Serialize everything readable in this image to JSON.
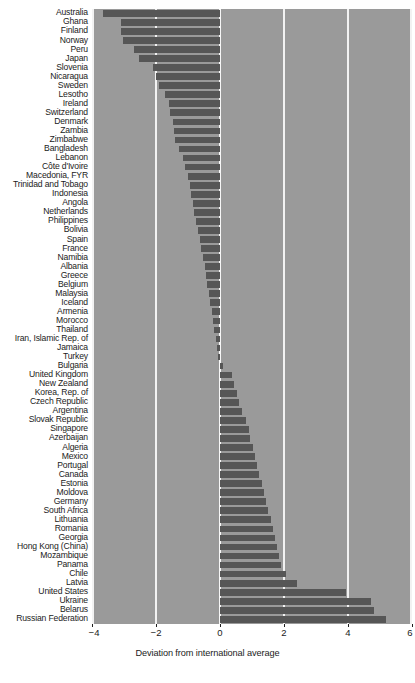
{
  "chart_data": {
    "type": "bar",
    "orientation": "horizontal",
    "title": "",
    "subtitle": "",
    "xlabel": "Deviation from international average",
    "ylabel": "",
    "xlim": [
      -4,
      6
    ],
    "ylim": null,
    "grid": true,
    "gridlines_x": [
      -4,
      -2,
      0,
      2,
      4,
      6
    ],
    "xticks": [
      -4,
      -2,
      0,
      2,
      4,
      6
    ],
    "xticklabels": [
      "−4",
      "−2",
      "0",
      "2",
      "4",
      "6"
    ],
    "legend": null,
    "legend_position": "none",
    "bar_color": "#565656",
    "plot_background_color": "#9a9a9a",
    "gridline_color": "#f2f2f2",
    "figure_background_color": "#ffffff",
    "categories": [
      "Australia",
      "Ghana",
      "Finland",
      "Norway",
      "Peru",
      "Japan",
      "Slovenia",
      "Nicaragua",
      "Sweden",
      "Lesotho",
      "Ireland",
      "Switzerland",
      "Denmark",
      "Zambia",
      "Zimbabwe",
      "Bangladesh",
      "Lebanon",
      "Côte d'Ivoire",
      "Macedonia, FYR",
      "Trinidad and Tobago",
      "Indonesia",
      "Angola",
      "Netherlands",
      "Philippines",
      "Bolivia",
      "Spain",
      "France",
      "Namibia",
      "Albania",
      "Greece",
      "Belgium",
      "Malaysia",
      "Iceland",
      "Armenia",
      "Morocco",
      "Thailand",
      "Iran, Islamic Rep. of",
      "Jamaica",
      "Turkey",
      "Bulgaria",
      "United Kingdom",
      "New Zealand",
      "Korea, Rep. of",
      "Czech Republic",
      "Argentina",
      "Slovak Republic",
      "Singapore",
      "Azerbaijan",
      "Algeria",
      "Mexico",
      "Portugal",
      "Canada",
      "Estonia",
      "Moldova",
      "Germany",
      "South Africa",
      "Lithuania",
      "Romania",
      "Georgia",
      "Hong Kong (China)",
      "Mozambique",
      "Panama",
      "Chile",
      "Latvia",
      "United States",
      "Ukraine",
      "Belarus",
      "Russian Federation"
    ],
    "values": [
      -3.65,
      -3.1,
      -3.08,
      -3.02,
      -2.7,
      -2.52,
      -2.08,
      -2.0,
      -1.9,
      -1.72,
      -1.58,
      -1.55,
      -1.48,
      -1.45,
      -1.4,
      -1.28,
      -1.15,
      -1.1,
      -1.0,
      -0.95,
      -0.9,
      -0.85,
      -0.8,
      -0.75,
      -0.7,
      -0.62,
      -0.58,
      -0.52,
      -0.48,
      -0.45,
      -0.4,
      -0.35,
      -0.3,
      -0.25,
      -0.22,
      -0.18,
      -0.12,
      -0.08,
      -0.05,
      0.1,
      0.38,
      0.45,
      0.52,
      0.58,
      0.7,
      0.8,
      0.9,
      0.95,
      1.02,
      1.08,
      1.15,
      1.22,
      1.3,
      1.38,
      1.45,
      1.5,
      1.58,
      1.65,
      1.72,
      1.78,
      1.85,
      1.92,
      2.05,
      2.42,
      3.95,
      4.72,
      4.8,
      5.2
    ]
  },
  "axis": {
    "x_title": "Deviation from international average",
    "tick_labels": [
      "−4",
      "−2",
      "0",
      "2",
      "4",
      "6"
    ]
  }
}
